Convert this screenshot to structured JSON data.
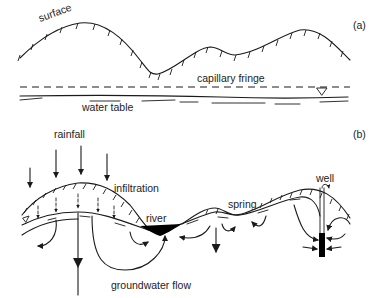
{
  "panel_a": {
    "tag": "(a)",
    "labels": {
      "surface": "surface",
      "capillary_fringe": "capillary fringe",
      "water_table": "water table"
    },
    "icons": [
      "water-table-triangle-icon"
    ]
  },
  "panel_b": {
    "tag": "(b)",
    "labels": {
      "rainfall": "rainfall",
      "infiltration": "infiltration",
      "river": "river",
      "spring": "spring",
      "well": "well",
      "groundwater_flow": "groundwater flow"
    },
    "icons": [
      "rainfall-arrow-icon",
      "infiltration-arrow-icon",
      "flow-arrow-icon",
      "well-icon",
      "water-table-triangle-icon"
    ]
  },
  "colors": {
    "ink": "#1a1a1a",
    "background": "#ffffff"
  }
}
